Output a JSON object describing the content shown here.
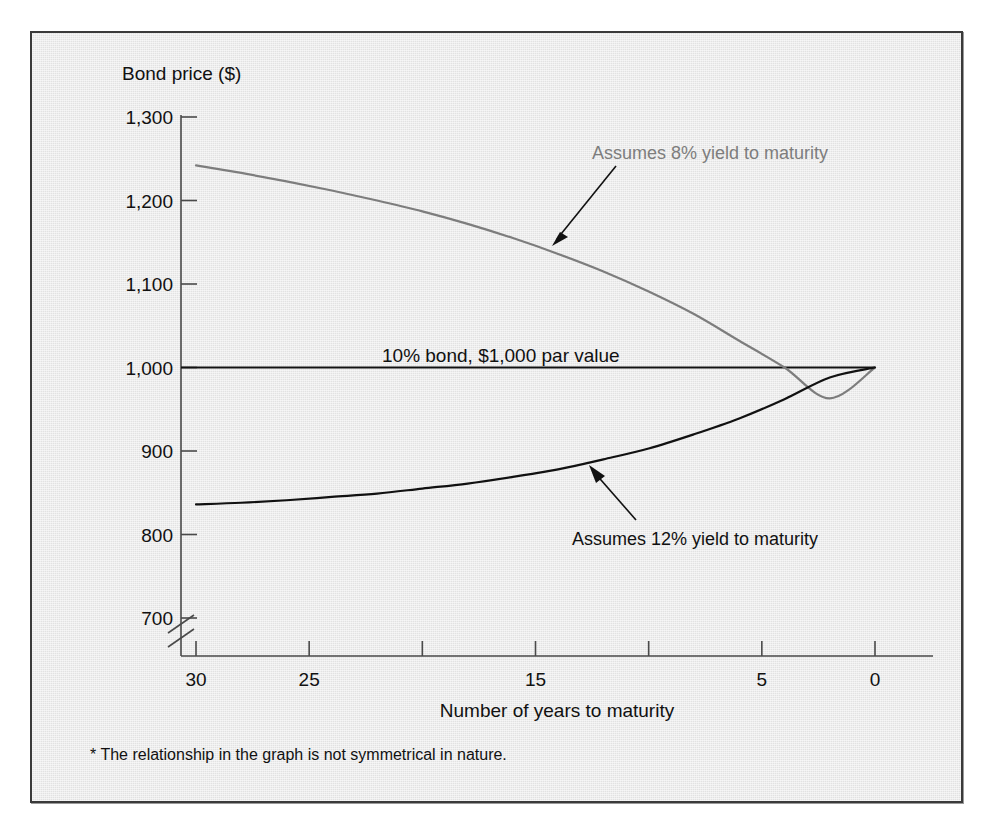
{
  "figure": {
    "background_color": "#e9e9e9",
    "border_color": "#3a3a3a",
    "footnote": "* The relationship in the graph is not symmetrical in nature."
  },
  "chart_data": {
    "type": "line",
    "title": "",
    "ylabel": "Bond price ($)",
    "xlabel": "Number of years to maturity",
    "xlim": [
      30,
      0
    ],
    "ylim": [
      700,
      1300
    ],
    "y_axis_break": true,
    "y_axis_break_below": 700,
    "grid": false,
    "legend_position": "inline-annotations",
    "x_ticks": [
      30,
      25,
      20,
      15,
      10,
      5,
      0
    ],
    "x_tick_labels": [
      "30",
      "25",
      "",
      "15",
      "",
      "5",
      "0"
    ],
    "y_ticks": [
      1300,
      1200,
      1100,
      1000,
      900,
      800,
      700
    ],
    "y_tick_labels": [
      "1,300",
      "1,200",
      "1,100",
      "1,000",
      "900",
      "800",
      "700"
    ],
    "x": [
      30,
      28,
      26,
      24,
      22,
      20,
      18,
      16,
      14,
      12,
      10,
      8,
      6,
      4,
      2,
      0
    ],
    "series": [
      {
        "name": "Assumes 8% yield to maturity",
        "color": "#7d7d7d",
        "stroke_width": 2.2,
        "values": [
          1242,
          1233,
          1223,
          1212,
          1200,
          1187,
          1172,
          1155,
          1136,
          1115,
          1091,
          1064,
          1032,
          1000,
          963,
          1000
        ]
      },
      {
        "name": "Assumes 12% yield to maturity",
        "color": "#111111",
        "stroke_width": 2.2,
        "values": [
          836,
          838,
          841,
          845,
          849,
          855,
          861,
          869,
          878,
          890,
          903,
          920,
          939,
          962,
          988,
          1000
        ]
      }
    ],
    "reference_line": {
      "label": "10% bond, $1,000 par value",
      "value": 1000,
      "color": "#111111"
    },
    "annotations": [
      {
        "text": "Assumes 8% yield to maturity",
        "color": "#7d7d7d",
        "target_years": 16.2,
        "target_price": 1150
      },
      {
        "text": "Assumes 12% yield to maturity",
        "color": "#111111",
        "target_years": 14.6,
        "target_price": 876
      }
    ]
  }
}
